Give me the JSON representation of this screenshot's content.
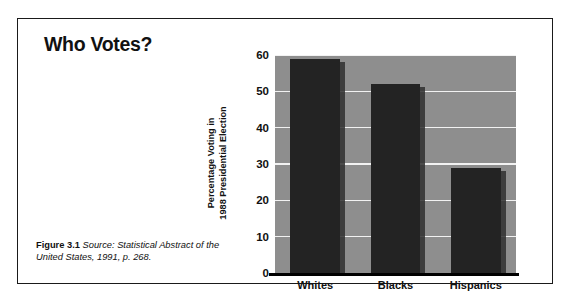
{
  "figure": {
    "title": "Who Votes?",
    "caption_label": "Figure 3.1",
    "caption_source": "Source: Statistical Abstract of the United States, 1991, p. 268."
  },
  "colors": {
    "bar": "#232323",
    "plot_background": "#8e8e8e",
    "gridline": "#f2f2f2",
    "axis": "#000000",
    "frame": "#1a1a1a",
    "page_background": "#ffffff"
  },
  "chart_data": {
    "type": "bar",
    "title": "Who Votes?",
    "categories": [
      "Whites",
      "Blacks",
      "Hispanics"
    ],
    "values": [
      59,
      52,
      29
    ],
    "xlabel": "",
    "ylabel": "Percentage Voting in 1988 Presidential Election",
    "ylabel_lines": [
      "Percentage Voting in",
      "1988 Presidential Election"
    ],
    "ylim": [
      0,
      60
    ],
    "yticks": [
      0,
      10,
      20,
      30,
      40,
      50,
      60
    ],
    "ytick_labels": [
      "0",
      "10",
      "20",
      "30",
      "40",
      "50",
      "60"
    ],
    "grid": true,
    "legend": false
  }
}
